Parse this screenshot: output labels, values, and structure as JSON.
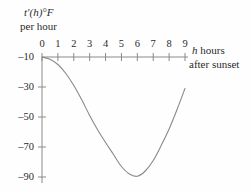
{
  "figure": {
    "background_color": "#fefefe",
    "line_color": "#8a8a8a",
    "axis_color": "#8a8a8a",
    "text_color": "#2b2b2b"
  },
  "labels": {
    "y_axis_line1_pre": "t",
    "y_axis_line1_prime": "′(",
    "y_axis_line1_var": "h",
    "y_axis_line1_post": ")°F",
    "y_axis_line1_full": "t′(h)°F",
    "y_axis_line2": "per hour",
    "x_axis_line1_var": "h",
    "x_axis_line1_rest": " hours",
    "x_axis_line2": "after sunset"
  },
  "chart_data": {
    "type": "line",
    "title": "",
    "xlabel": "h hours after sunset",
    "ylabel": "t'(h) °F per hour",
    "xlim": [
      0,
      9
    ],
    "ylim": [
      -90,
      -10
    ],
    "grid": false,
    "legend": null,
    "x_ticks": [
      0,
      1,
      2,
      3,
      4,
      5,
      6,
      7,
      8,
      9
    ],
    "x_tick_labels": [
      "0",
      "1",
      "2",
      "3",
      "4",
      "5",
      "6",
      "7",
      "8",
      "9"
    ],
    "y_ticks": [
      -10,
      -30,
      -50,
      -70,
      -90
    ],
    "y_tick_labels": [
      "–10",
      "–30",
      "–50",
      "–70",
      "–90"
    ],
    "series": [
      {
        "name": "t'(h)",
        "x": [
          0,
          0.5,
          1,
          1.5,
          2,
          2.5,
          3,
          3.5,
          4,
          4.5,
          5,
          5.5,
          6,
          6.5,
          7,
          7.5,
          8,
          8.5,
          9
        ],
        "y": [
          -10,
          -11.5,
          -15,
          -21,
          -29,
          -38.5,
          -49,
          -58.5,
          -67,
          -75,
          -83,
          -88,
          -89.5,
          -86,
          -79,
          -69,
          -58,
          -45,
          -31
        ]
      }
    ]
  }
}
